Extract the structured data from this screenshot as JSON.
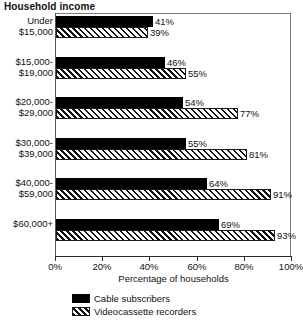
{
  "title": "Household income",
  "chart_data": {
    "type": "bar",
    "orientation": "horizontal",
    "title": "Household income",
    "xlabel": "Percentage of households",
    "ylabel": "",
    "xlim": [
      0,
      100
    ],
    "xticks": [
      0,
      20,
      40,
      60,
      80,
      100
    ],
    "xtick_labels": [
      "0%",
      "20%",
      "40%",
      "60%",
      "80%",
      "100%"
    ],
    "grid": false,
    "legend_position": "bottom-left",
    "categories": [
      "Under $15,000",
      "$15,000-$19,000",
      "$20,000-$29,000",
      "$30,000-$39,000",
      "$40,000-$59,000",
      "$60,000+"
    ],
    "category_lines": [
      [
        "Under",
        "$15,000"
      ],
      [
        "$15,000-",
        "$19,000"
      ],
      [
        "$20,000-",
        "$29,000"
      ],
      [
        "$30,000-",
        "$39,000"
      ],
      [
        "$40,000-",
        "$59,000"
      ],
      [
        "$60,000+",
        ""
      ]
    ],
    "series": [
      {
        "name": "Cable subscribers",
        "fill": "solid",
        "color": "#000000",
        "values": [
          41,
          46,
          54,
          55,
          64,
          69
        ],
        "labels": [
          "41%",
          "46%",
          "54%",
          "55%",
          "64%",
          "69%"
        ]
      },
      {
        "name": "Videocassette recorders",
        "fill": "hatch",
        "color": "#ffffff",
        "values": [
          39,
          55,
          77,
          81,
          91,
          93
        ],
        "labels": [
          "39%",
          "55%",
          "77%",
          "81%",
          "91%",
          "93%"
        ]
      }
    ]
  },
  "axis": {
    "x_title": "Percentage of households",
    "tick_labels": [
      "0%",
      "20%",
      "40%",
      "60%",
      "80%",
      "100%"
    ]
  },
  "legend": {
    "items": [
      {
        "label": "Cable subscribers",
        "fill": "solid"
      },
      {
        "label": "Videocassette recorders",
        "fill": "hatch"
      }
    ]
  }
}
